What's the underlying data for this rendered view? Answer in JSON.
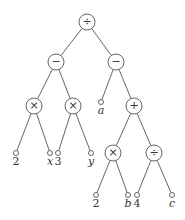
{
  "diagram": {
    "type": "expression-tree",
    "nodes": [
      {
        "id": "n0",
        "label": "÷",
        "kind": "op",
        "x": 87,
        "y": 22
      },
      {
        "id": "n1",
        "label": "−",
        "kind": "op",
        "x": 56,
        "y": 62
      },
      {
        "id": "n2",
        "label": "−",
        "kind": "op",
        "x": 116,
        "y": 62
      },
      {
        "id": "n3",
        "label": "×",
        "kind": "op",
        "x": 34,
        "y": 106
      },
      {
        "id": "n4",
        "label": "×",
        "kind": "op",
        "x": 73,
        "y": 106
      },
      {
        "id": "n5",
        "label": "a",
        "kind": "leaf",
        "x": 101,
        "y": 102,
        "italic": true
      },
      {
        "id": "n6",
        "label": "+",
        "kind": "op",
        "x": 134,
        "y": 106
      },
      {
        "id": "n7",
        "label": "2",
        "kind": "leaf",
        "x": 16,
        "y": 153,
        "italic": false
      },
      {
        "id": "n8",
        "label": "x",
        "kind": "leaf",
        "x": 50,
        "y": 153,
        "italic": true
      },
      {
        "id": "n9",
        "label": "3",
        "kind": "leaf",
        "x": 58,
        "y": 153,
        "italic": false
      },
      {
        "id": "n10",
        "label": "y",
        "kind": "leaf",
        "x": 91,
        "y": 153,
        "italic": true
      },
      {
        "id": "n11",
        "label": "×",
        "kind": "op",
        "x": 113,
        "y": 153
      },
      {
        "id": "n12",
        "label": "÷",
        "kind": "op",
        "x": 154,
        "y": 153
      },
      {
        "id": "n13",
        "label": "2",
        "kind": "leaf",
        "x": 96,
        "y": 195,
        "italic": false
      },
      {
        "id": "n14",
        "label": "b",
        "kind": "leaf",
        "x": 128,
        "y": 195,
        "italic": true
      },
      {
        "id": "n15",
        "label": "4",
        "kind": "leaf",
        "x": 137,
        "y": 195,
        "italic": false
      },
      {
        "id": "n16",
        "label": "c",
        "kind": "leaf",
        "x": 172,
        "y": 195,
        "italic": true
      }
    ],
    "edges": [
      [
        "n0",
        "n1"
      ],
      [
        "n0",
        "n2"
      ],
      [
        "n1",
        "n3"
      ],
      [
        "n1",
        "n4"
      ],
      [
        "n2",
        "n5"
      ],
      [
        "n2",
        "n6"
      ],
      [
        "n3",
        "n7"
      ],
      [
        "n3",
        "n8"
      ],
      [
        "n4",
        "n9"
      ],
      [
        "n4",
        "n10"
      ],
      [
        "n6",
        "n11"
      ],
      [
        "n6",
        "n12"
      ],
      [
        "n11",
        "n13"
      ],
      [
        "n11",
        "n14"
      ],
      [
        "n12",
        "n15"
      ],
      [
        "n12",
        "n16"
      ]
    ]
  }
}
